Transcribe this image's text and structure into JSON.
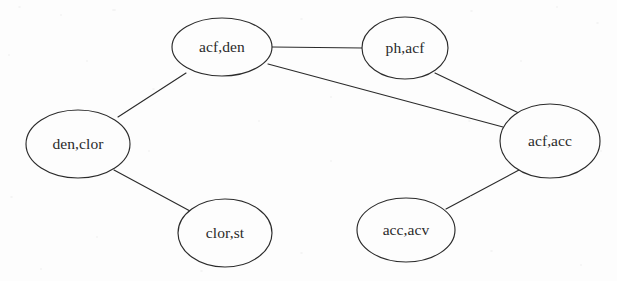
{
  "diagram": {
    "type": "undirected-graph",
    "title": "",
    "background_color": "#fdfdfd",
    "stroke_color": "#2b2b2b",
    "text_color": "#2a2a2a",
    "nodes": [
      {
        "id": "acf_den",
        "label": "acf,den",
        "cx": 222,
        "cy": 47,
        "rx": 50,
        "ry": 29
      },
      {
        "id": "ph_acf",
        "label": "ph,acf",
        "cx": 405,
        "cy": 48,
        "rx": 43,
        "ry": 31
      },
      {
        "id": "den_clor",
        "label": "den,clor",
        "cx": 78,
        "cy": 144,
        "rx": 52,
        "ry": 34
      },
      {
        "id": "acf_acc",
        "label": "acf,acc",
        "cx": 550,
        "cy": 141,
        "rx": 50,
        "ry": 37
      },
      {
        "id": "clor_st",
        "label": "clor,st",
        "cx": 225,
        "cy": 233,
        "rx": 47,
        "ry": 34
      },
      {
        "id": "acc_acv",
        "label": "acc,acv",
        "cx": 406,
        "cy": 230,
        "rx": 49,
        "ry": 32
      }
    ],
    "edges": [
      {
        "id": "e1",
        "source": "acf_den",
        "target": "ph_acf",
        "x1": 272,
        "y1": 47,
        "x2": 363,
        "y2": 48
      },
      {
        "id": "e2",
        "source": "acf_den",
        "target": "acf_acc",
        "x1": 268,
        "y1": 64,
        "x2": 503,
        "y2": 127
      },
      {
        "id": "e3",
        "source": "acf_den",
        "target": "den_clor",
        "x1": 186,
        "y1": 73,
        "x2": 118,
        "y2": 117
      },
      {
        "id": "e4",
        "source": "ph_acf",
        "target": "acf_acc",
        "x1": 435,
        "y1": 73,
        "x2": 523,
        "y2": 115
      },
      {
        "id": "e5",
        "source": "den_clor",
        "target": "clor_st",
        "x1": 114,
        "y1": 170,
        "x2": 190,
        "y2": 211
      },
      {
        "id": "e6",
        "source": "acf_acc",
        "target": "acc_acv",
        "x1": 519,
        "y1": 170,
        "x2": 446,
        "y2": 209
      }
    ]
  }
}
